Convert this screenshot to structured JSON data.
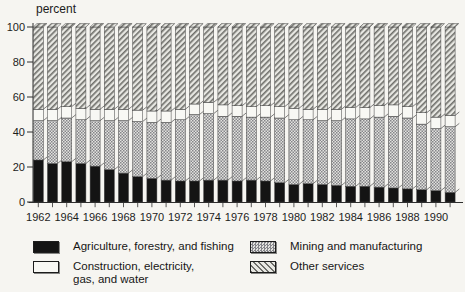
{
  "unit_label": "percent",
  "y_axis": {
    "ticks": [
      0,
      20,
      40,
      60,
      80,
      100
    ]
  },
  "x_axis": {
    "labels": [
      "1962",
      "1964",
      "1966",
      "1968",
      "1970",
      "1972",
      "1974",
      "1976",
      "1978",
      "1980",
      "1982",
      "1984",
      "1986",
      "1988",
      "1990"
    ]
  },
  "chart_data": {
    "type": "bar",
    "stacked": true,
    "title": "",
    "xlabel": "",
    "ylabel": "percent",
    "ylim": [
      0,
      100
    ],
    "x_tick_label_step": 2,
    "legend_position": "bottom",
    "x": [
      1962,
      1963,
      1964,
      1965,
      1966,
      1967,
      1968,
      1969,
      1970,
      1971,
      1972,
      1973,
      1974,
      1975,
      1976,
      1977,
      1978,
      1979,
      1980,
      1981,
      1982,
      1983,
      1984,
      1985,
      1986,
      1987,
      1988,
      1989,
      1990,
      1991
    ],
    "series": [
      {
        "name": "Agriculture, forestry, and fishing",
        "pattern": "solid-black",
        "values": [
          24,
          22,
          23,
          22,
          20.5,
          18.5,
          16.5,
          14.5,
          13.5,
          12.5,
          12,
          12,
          12.5,
          12.5,
          12,
          12.5,
          12,
          11,
          10,
          10.5,
          10,
          9.5,
          9,
          9,
          8.5,
          8,
          7.5,
          7,
          6.5,
          5.5
        ]
      },
      {
        "name": "Mining and manufacturing",
        "pattern": "checker",
        "values": [
          22.5,
          24.5,
          25,
          25,
          26,
          28,
          30,
          31.5,
          32,
          33,
          35,
          38,
          38,
          36.5,
          37,
          36,
          36.5,
          37,
          37,
          36.5,
          36.5,
          37,
          38.5,
          38.5,
          40,
          41,
          40.5,
          37.5,
          35.5,
          37.5
        ]
      },
      {
        "name": "Construction, electricity, gas, and water",
        "pattern": "white",
        "values": [
          6.5,
          6.5,
          6.5,
          6.5,
          6.5,
          6.5,
          6.5,
          6.5,
          6.5,
          6.5,
          6,
          6,
          6.5,
          6.5,
          6,
          6,
          6.5,
          6.5,
          6.5,
          6,
          6.5,
          6.5,
          6.5,
          6.5,
          6.5,
          6.5,
          6.5,
          6.5,
          6.5,
          6.5
        ]
      },
      {
        "name": "Other services",
        "pattern": "diagonal",
        "values": [
          47,
          47,
          45.5,
          46.5,
          47,
          47,
          47,
          47.5,
          48,
          48,
          47,
          44,
          43,
          44.5,
          45,
          45.5,
          45,
          45.5,
          46.5,
          47,
          47,
          47,
          46,
          46,
          45,
          44.5,
          45.5,
          49,
          51.5,
          50.5
        ]
      }
    ]
  },
  "legend": {
    "items": [
      {
        "id": "agriculture",
        "label": "Agriculture, forestry, and fishing",
        "swatch": "solid-black"
      },
      {
        "id": "construction",
        "label_line1": "Construction, electricity,",
        "label_line2": "gas, and water",
        "swatch": "white"
      },
      {
        "id": "mining",
        "label": "Mining and manufacturing",
        "swatch": "checker"
      },
      {
        "id": "other",
        "label": "Other services",
        "swatch": "diagonal"
      }
    ]
  },
  "colors": {
    "background": "#f6f5f1",
    "bar_black": "#141414",
    "hatch_dark": "#85858a",
    "hatch_light": "#e3e3df",
    "diag_dark": "#6e6e6a",
    "diag_light": "#e7e7e2",
    "white_segment": "#f8f8f4",
    "axis": "#2e2e2e"
  }
}
